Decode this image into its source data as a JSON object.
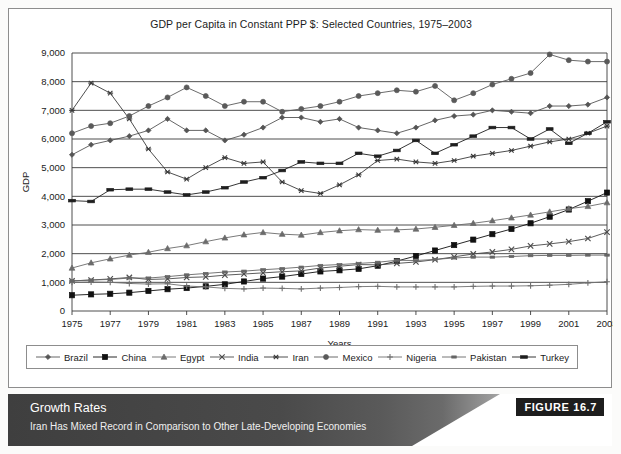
{
  "figure": {
    "title": "GDP per Capita in Constant PPP $: Selected Countries, 1975–2003",
    "caption_title": "Growth Rates",
    "caption_subtitle": "Iran Has Mixed Record in Comparison to Other Late-Developing Economies",
    "badge": "FIGURE 16.7"
  },
  "chart_data": {
    "type": "line",
    "title": "GDP per Capita in Constant PPP $: Selected Countries, 1975–2003",
    "xlabel": "Years",
    "ylabel": "GDP",
    "xlim": [
      1975,
      2003
    ],
    "ylim": [
      0,
      9000
    ],
    "ytick_labels": [
      "0",
      "1,000",
      "2,000",
      "3,000",
      "4,000",
      "5,000",
      "6,000",
      "7,000",
      "8,000",
      "9,000"
    ],
    "ytick_values": [
      0,
      1000,
      2000,
      3000,
      4000,
      5000,
      6000,
      7000,
      8000,
      9000
    ],
    "xtick_labels": [
      "1975",
      "1977",
      "1979",
      "1981",
      "1983",
      "1985",
      "1987",
      "1989",
      "1991",
      "1993",
      "1995",
      "1997",
      "1999",
      "2001",
      "2003"
    ],
    "xtick_values": [
      1975,
      1977,
      1979,
      1981,
      1983,
      1985,
      1987,
      1989,
      1991,
      1993,
      1995,
      1997,
      1999,
      2001,
      2003
    ],
    "grid": "horizontal",
    "legend_position": "bottom",
    "x": [
      1975,
      1976,
      1977,
      1978,
      1979,
      1980,
      1981,
      1982,
      1983,
      1984,
      1985,
      1986,
      1987,
      1988,
      1989,
      1990,
      1991,
      1992,
      1993,
      1994,
      1995,
      1996,
      1997,
      1998,
      1999,
      2000,
      2001,
      2002,
      2003
    ],
    "series": [
      {
        "name": "Brazil",
        "marker": "diamond",
        "color": "#555555",
        "values": [
          5450,
          5800,
          5950,
          6100,
          6300,
          6700,
          6300,
          6300,
          5950,
          6150,
          6400,
          6750,
          6750,
          6600,
          6700,
          6400,
          6300,
          6200,
          6400,
          6650,
          6800,
          6850,
          7000,
          6950,
          6900,
          7150,
          7150,
          7200,
          7450
        ]
      },
      {
        "name": "China",
        "marker": "square",
        "color": "#111111",
        "values": [
          550,
          580,
          600,
          640,
          700,
          760,
          800,
          860,
          930,
          1030,
          1130,
          1200,
          1290,
          1380,
          1420,
          1470,
          1580,
          1740,
          1920,
          2110,
          2300,
          2490,
          2680,
          2860,
          3060,
          3290,
          3540,
          3830,
          4130
        ]
      },
      {
        "name": "Egypt",
        "marker": "triangle",
        "color": "#6b6b6b",
        "values": [
          1500,
          1680,
          1820,
          1950,
          2050,
          2180,
          2280,
          2420,
          2550,
          2660,
          2740,
          2680,
          2650,
          2740,
          2800,
          2840,
          2820,
          2830,
          2860,
          2920,
          2990,
          3060,
          3150,
          3250,
          3350,
          3460,
          3570,
          3650,
          3780
        ]
      },
      {
        "name": "India",
        "marker": "x",
        "color": "#4a4a4a",
        "values": [
          1050,
          1080,
          1120,
          1170,
          1100,
          1120,
          1170,
          1190,
          1250,
          1290,
          1330,
          1370,
          1400,
          1500,
          1560,
          1620,
          1610,
          1660,
          1710,
          1790,
          1890,
          1990,
          2060,
          2150,
          2270,
          2340,
          2420,
          2530,
          2750
        ]
      },
      {
        "name": "Iran",
        "marker": "star",
        "color": "#3a3a3a",
        "values": [
          7000,
          7950,
          7600,
          6700,
          5650,
          4850,
          4600,
          5000,
          5350,
          5150,
          5200,
          4500,
          4200,
          4100,
          4400,
          4750,
          5250,
          5300,
          5200,
          5150,
          5250,
          5400,
          5500,
          5600,
          5750,
          5900,
          6000,
          6200,
          6450
        ]
      },
      {
        "name": "Mexico",
        "marker": "circle",
        "color": "#5a5a5a",
        "values": [
          6200,
          6450,
          6550,
          6800,
          7150,
          7450,
          7800,
          7500,
          7150,
          7300,
          7300,
          6950,
          7050,
          7150,
          7300,
          7500,
          7600,
          7700,
          7650,
          7850,
          7350,
          7600,
          7900,
          8100,
          8300,
          8950,
          8750,
          8700,
          8700
        ]
      },
      {
        "name": "Nigeria",
        "marker": "plus",
        "color": "#707070",
        "values": [
          1000,
          1010,
          1000,
          960,
          940,
          950,
          870,
          840,
          790,
          770,
          800,
          790,
          770,
          800,
          820,
          850,
          860,
          840,
          840,
          840,
          840,
          860,
          870,
          870,
          880,
          900,
          930,
          980,
          1020
        ]
      },
      {
        "name": "Pakistan",
        "marker": "dash-small",
        "color": "#666666",
        "values": [
          1050,
          1080,
          1100,
          1150,
          1150,
          1200,
          1260,
          1310,
          1360,
          1390,
          1440,
          1480,
          1530,
          1590,
          1620,
          1660,
          1700,
          1770,
          1760,
          1800,
          1850,
          1880,
          1880,
          1900,
          1930,
          1940,
          1940,
          1950,
          1950
        ]
      },
      {
        "name": "Turkey",
        "marker": "dash-wide",
        "color": "#1f1f1f",
        "values": [
          3850,
          3820,
          4230,
          4250,
          4250,
          4150,
          4050,
          4150,
          4300,
          4500,
          4650,
          4900,
          5200,
          5150,
          5150,
          5500,
          5400,
          5600,
          5950,
          5500,
          5800,
          6100,
          6400,
          6400,
          6000,
          6350,
          5850,
          6200,
          6600
        ]
      }
    ]
  },
  "legend": {
    "items": [
      {
        "label": "Brazil",
        "marker": "diamond"
      },
      {
        "label": "China",
        "marker": "square"
      },
      {
        "label": "Egypt",
        "marker": "triangle"
      },
      {
        "label": "India",
        "marker": "x"
      },
      {
        "label": "Iran",
        "marker": "star"
      },
      {
        "label": "Mexico",
        "marker": "circle"
      },
      {
        "label": "Nigeria",
        "marker": "plus"
      },
      {
        "label": "Pakistan",
        "marker": "dash-small"
      },
      {
        "label": "Turkey",
        "marker": "dash-wide"
      }
    ]
  }
}
